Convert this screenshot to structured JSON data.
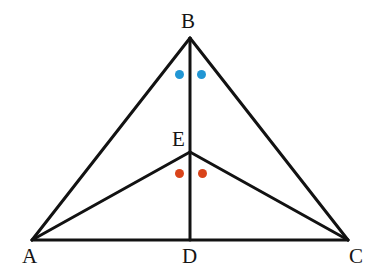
{
  "figure": {
    "kind": "geometry-diagram",
    "background_color": "#ffffff",
    "stroke_color": "#121212",
    "stroke_width": 3,
    "label_color": "#151515",
    "canvas": {
      "width": 374,
      "height": 270
    }
  },
  "points": [
    {
      "id": "A",
      "label": "A",
      "x": 32,
      "y": 240,
      "label_x": 22,
      "label_y": 246
    },
    {
      "id": "B",
      "label": "B",
      "x": 190,
      "y": 38,
      "label_x": 181,
      "label_y": 11
    },
    {
      "id": "C",
      "label": "C",
      "x": 348,
      "y": 240,
      "label_x": 349,
      "label_y": 246
    },
    {
      "id": "D",
      "label": "D",
      "x": 190,
      "y": 240,
      "label_x": 182,
      "label_y": 246
    },
    {
      "id": "E",
      "label": "E",
      "x": 190,
      "y": 152,
      "label_x": 172,
      "label_y": 129
    }
  ],
  "segments": [
    {
      "id": "AB",
      "from": "A",
      "to": "B",
      "x1": 32,
      "y1": 240,
      "x2": 190,
      "y2": 38
    },
    {
      "id": "BC",
      "from": "B",
      "to": "C",
      "x1": 190,
      "y1": 38,
      "x2": 348,
      "y2": 240
    },
    {
      "id": "AC",
      "from": "A",
      "to": "C",
      "x1": 32,
      "y1": 240,
      "x2": 348,
      "y2": 240
    },
    {
      "id": "BD",
      "from": "B",
      "to": "D",
      "x1": 190,
      "y1": 38,
      "x2": 190,
      "y2": 240
    },
    {
      "id": "AE",
      "from": "A",
      "to": "E",
      "x1": 32,
      "y1": 240,
      "x2": 190,
      "y2": 152
    },
    {
      "id": "EC",
      "from": "E",
      "to": "C",
      "x1": 190,
      "y1": 152,
      "x2": 348,
      "y2": 240
    }
  ],
  "markers": [
    {
      "id": "blue-left",
      "color": "#2196d4",
      "x": 179,
      "y": 74,
      "radius": 4.5,
      "region": "angle-ABD"
    },
    {
      "id": "blue-right",
      "color": "#2196d4",
      "x": 201,
      "y": 74,
      "radius": 4.5,
      "region": "angle-DBC"
    },
    {
      "id": "red-left",
      "color": "#d9441a",
      "x": 179,
      "y": 173,
      "radius": 4.5,
      "region": "angle-AED"
    },
    {
      "id": "red-right",
      "color": "#d9441a",
      "x": 202,
      "y": 173,
      "radius": 4.5,
      "region": "angle-DEC"
    }
  ]
}
